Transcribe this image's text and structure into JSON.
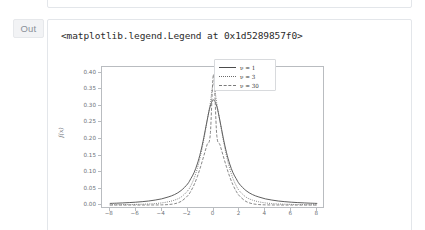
{
  "notebook": {
    "gutter_label": "Out",
    "output_repr": "<matplotlib.legend.Legend at 0x1d5289857f0>"
  },
  "chart_data": {
    "type": "line",
    "title": "",
    "xlabel": "x",
    "ylabel": "f(x)",
    "xlim": [
      -8.6,
      8.6
    ],
    "ylim": [
      -0.012,
      0.418
    ],
    "grid": false,
    "legend_position": "upper right",
    "xticks": [
      -8,
      -6,
      -4,
      -2,
      0,
      2,
      4,
      6,
      8
    ],
    "xticklabels": [
      "−8",
      "−6",
      "−4",
      "−2",
      "0",
      "2",
      "4",
      "6",
      "8"
    ],
    "yticks": [
      0.0,
      0.05,
      0.1,
      0.15,
      0.2,
      0.25,
      0.3,
      0.35,
      0.4
    ],
    "yticklabels": [
      "0.00",
      "0.05",
      "0.10",
      "0.15",
      "0.20",
      "0.25",
      "0.30",
      "0.35",
      "0.40"
    ],
    "x": [
      -8,
      -7.5,
      -7,
      -6.5,
      -6,
      -5.5,
      -5,
      -4.5,
      -4,
      -3.5,
      -3,
      -2.5,
      -2,
      -1.75,
      -1.5,
      -1.25,
      -1,
      -0.75,
      -0.5,
      -0.25,
      0,
      0.25,
      0.5,
      0.75,
      1,
      1.25,
      1.5,
      1.75,
      2,
      2.5,
      3,
      3.5,
      4,
      4.5,
      5,
      5.5,
      6,
      6.5,
      7,
      7.5,
      8
    ],
    "series": [
      {
        "name": "ν = 1",
        "label": "ν = 1",
        "linestyle": "solid",
        "color": "#4c4c4c",
        "peak": 0.3183,
        "values": [
          0.0049,
          0.0056,
          0.0064,
          0.0074,
          0.0086,
          0.0102,
          0.0122,
          0.0151,
          0.0187,
          0.0243,
          0.0318,
          0.0439,
          0.0637,
          0.0798,
          0.098,
          0.1244,
          0.1592,
          0.2037,
          0.2546,
          0.2996,
          0.3183,
          0.2996,
          0.2546,
          0.2037,
          0.1592,
          0.1244,
          0.098,
          0.0798,
          0.0637,
          0.0439,
          0.0318,
          0.0243,
          0.0187,
          0.0151,
          0.0122,
          0.0102,
          0.0086,
          0.0074,
          0.0064,
          0.0056,
          0.0049
        ]
      },
      {
        "name": "ν = 3",
        "label": "ν = 3",
        "linestyle": "dotted",
        "color": "#6a6a6a",
        "peak": 0.3676,
        "values": [
          0.0008,
          0.001,
          0.0012,
          0.0015,
          0.0019,
          0.0025,
          0.0033,
          0.0045,
          0.0065,
          0.0097,
          0.015,
          0.0242,
          0.0427,
          0.0587,
          0.0806,
          0.1104,
          0.1496,
          0.198,
          0.2531,
          0.3082,
          0.3676,
          0.3082,
          0.2531,
          0.198,
          0.1496,
          0.1104,
          0.0806,
          0.0587,
          0.0427,
          0.0242,
          0.015,
          0.0097,
          0.0065,
          0.0045,
          0.0033,
          0.0025,
          0.0019,
          0.0015,
          0.0012,
          0.001,
          0.0008
        ]
      },
      {
        "name": "ν = 30",
        "label": "ν = 30",
        "linestyle": "dashed",
        "color": "#7a7a7a",
        "peak": 0.3956,
        "values": [
          0.0,
          0.0,
          0.0,
          0.0,
          0.0,
          0.0,
          0.0001,
          0.0002,
          0.0005,
          0.0014,
          0.004,
          0.011,
          0.0277,
          0.0418,
          0.0611,
          0.0858,
          0.1155,
          0.1486,
          0.1823,
          0.2128,
          0.3956,
          0.2128,
          0.1823,
          0.1486,
          0.1155,
          0.0858,
          0.0611,
          0.0418,
          0.0277,
          0.011,
          0.004,
          0.0014,
          0.0005,
          0.0002,
          0.0001,
          0.0,
          0.0,
          0.0,
          0.0,
          0.0,
          0.0
        ]
      }
    ]
  },
  "colors": {
    "cell_border": "#e3e6ea",
    "gutter_bg": "#f2f3f5",
    "gutter_text": "#8a9099",
    "axis": "#b9bcc0",
    "tick_text": "#6d7177"
  }
}
